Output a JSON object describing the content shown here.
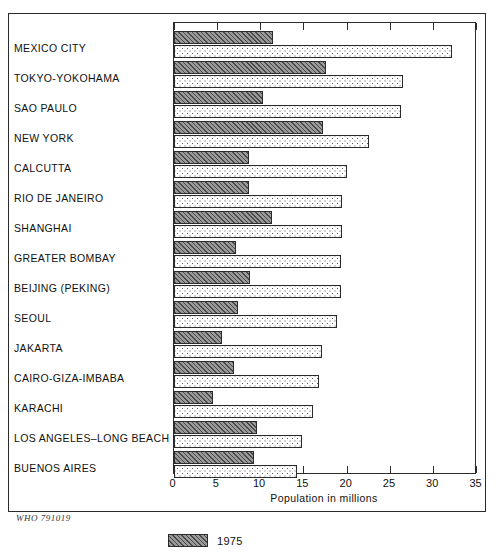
{
  "figure": {
    "source_note": "WHO 791019"
  },
  "legend": {
    "entries": [
      {
        "label": "1975",
        "pattern": "diagonal-hatch"
      }
    ]
  },
  "axis": {
    "title": "Population in millions",
    "ticks": [
      "0",
      "5",
      "10",
      "15",
      "20",
      "25",
      "30",
      "35"
    ]
  },
  "chart_data": {
    "type": "bar",
    "orientation": "horizontal",
    "title": "",
    "subtitle": "",
    "xlabel": "Population in millions",
    "ylabel": "",
    "xlim": [
      0,
      35
    ],
    "xticks": [
      0,
      5,
      10,
      15,
      20,
      25,
      30,
      35
    ],
    "grid": false,
    "legend_position": "bottom-center",
    "categories": [
      "MEXICO CITY",
      "TOKYO-YOKOHAMA",
      "SAO PAULO",
      "NEW YORK",
      "CALCUTTA",
      "RIO DE JANEIRO",
      "SHANGHAI",
      "GREATER BOMBAY",
      "BEIJING (PEKING)",
      "SEOUL",
      "JAKARTA",
      "CAIRO-GIZA-IMBABA",
      "KARACHI",
      "LOS ANGELES–LONG BEACH",
      "BUENOS AIRES"
    ],
    "series": [
      {
        "name": "1975",
        "pattern": "diagonal-hatch",
        "values": [
          11.5,
          17.6,
          10.3,
          17.3,
          8.7,
          8.7,
          11.4,
          7.2,
          8.8,
          7.5,
          5.6,
          7.0,
          4.6,
          9.6,
          9.3
        ]
      },
      {
        "name": "2000",
        "pattern": "stipple-dots",
        "values": [
          32.2,
          26.5,
          26.3,
          22.6,
          20.0,
          19.5,
          19.5,
          19.4,
          19.3,
          18.9,
          17.1,
          16.8,
          16.1,
          14.8,
          14.3
        ]
      }
    ]
  }
}
